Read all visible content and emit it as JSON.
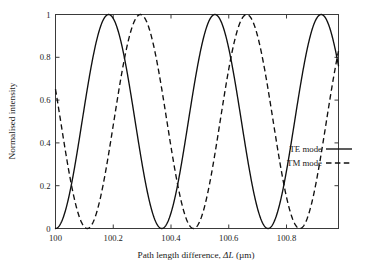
{
  "chart_data": {
    "type": "line",
    "title": "",
    "xlabel": "Path length difference, ΔL (µm)",
    "xlabel_parts": {
      "prefix": "Path length difference, ",
      "variable": "ΔL",
      "suffix": " (µm)"
    },
    "ylabel": "Normalised intensity",
    "xlim": [
      100.0,
      100.98
    ],
    "ylim": [
      0,
      1
    ],
    "xticks": [
      100,
      100.2,
      100.4,
      100.6,
      100.8
    ],
    "xticklabels": [
      "100",
      "100.2",
      "100.4",
      "100.6",
      "100.8"
    ],
    "yticks": [
      0,
      0.2,
      0.4,
      0.6,
      0.8,
      1
    ],
    "yticklabels": [
      "0",
      "0.2",
      "0.4",
      "0.6",
      "0.8",
      "1"
    ],
    "grid": false,
    "legend_position": "center-right",
    "series": [
      {
        "name": "TE mode",
        "linestyle": "solid",
        "color": "#101010",
        "form": "raised-cosine",
        "period": 0.368,
        "min_x": 100.0,
        "amplitude": 1.0,
        "offset": 0.0,
        "minima_x": [
          100.0,
          100.368,
          100.736
        ],
        "maxima_x": [
          100.184,
          100.552,
          100.92
        ],
        "value_at_x_start": 0.01,
        "value_at_x_end": 0.82
      },
      {
        "name": "TM mode",
        "linestyle": "dashed",
        "color": "#101010",
        "form": "raised-cosine",
        "period": 0.368,
        "min_x": 100.11,
        "amplitude": 1.0,
        "offset": 0.0,
        "minima_x": [
          100.11,
          100.478,
          100.846
        ],
        "maxima_x": [
          100.294,
          100.662,
          101.03
        ],
        "value_at_x_start": 0.62,
        "value_at_x_end": 0.86
      }
    ]
  },
  "legend": {
    "entries": [
      {
        "label": "TE mode",
        "style": "solid"
      },
      {
        "label": "TM mode",
        "style": "dashed"
      }
    ]
  }
}
